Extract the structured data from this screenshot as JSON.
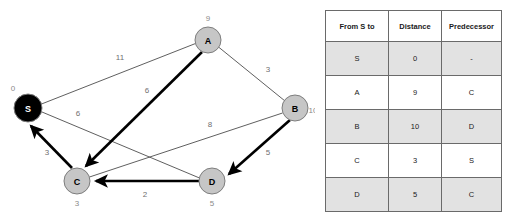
{
  "graph": {
    "nodes": [
      {
        "id": "S",
        "label": "S",
        "distance": "0",
        "cx": 28,
        "cy": 108,
        "r": 14,
        "style": "black",
        "dist_x": 13,
        "dist_y": 88
      },
      {
        "id": "A",
        "label": "A",
        "distance": "9",
        "cx": 208,
        "cy": 40,
        "r": 13,
        "style": "gray",
        "dist_x": 208,
        "dist_y": 18
      },
      {
        "id": "B",
        "label": "B",
        "distance": "10",
        "cx": 295,
        "cy": 108,
        "r": 13,
        "style": "gray",
        "dist_x": 317,
        "dist_y": 110
      },
      {
        "id": "C",
        "label": "C",
        "distance": "3",
        "cx": 77,
        "cy": 181,
        "r": 13,
        "style": "gray",
        "dist_x": 77,
        "dist_y": 203
      },
      {
        "id": "D",
        "label": "D",
        "distance": "5",
        "cx": 212,
        "cy": 181,
        "r": 13,
        "style": "gray",
        "dist_x": 212,
        "dist_y": 203
      }
    ],
    "edges": [
      {
        "id": "S-A",
        "from": "S",
        "to": "A",
        "weight": "11",
        "kind": "thin",
        "directed": false,
        "label_x": 120,
        "label_y": 57
      },
      {
        "id": "A-B",
        "from": "A",
        "to": "B",
        "weight": "3",
        "kind": "thin",
        "directed": false,
        "label_x": 268,
        "label_y": 69
      },
      {
        "id": "S-D",
        "from": "S",
        "to": "D",
        "weight": "6",
        "kind": "thin",
        "directed": false,
        "label_x": 78,
        "label_y": 113
      },
      {
        "id": "B-C",
        "from": "B",
        "to": "C",
        "weight": "8",
        "kind": "thin",
        "directed": false,
        "label_x": 210,
        "label_y": 124
      },
      {
        "id": "A-C",
        "from": "A",
        "to": "C",
        "weight": "6",
        "kind": "thick",
        "directed": true,
        "label_x": 147,
        "label_y": 90
      },
      {
        "id": "C-S",
        "from": "C",
        "to": "S",
        "weight": "3",
        "kind": "thick",
        "directed": true,
        "label_x": 47,
        "label_y": 152
      },
      {
        "id": "B-D",
        "from": "B",
        "to": "D",
        "weight": "5",
        "kind": "thick",
        "directed": true,
        "label_x": 268,
        "label_y": 152
      },
      {
        "id": "D-C",
        "from": "D",
        "to": "C",
        "weight": "2",
        "kind": "thick",
        "directed": true,
        "label_x": 145,
        "label_y": 194
      }
    ]
  },
  "table": {
    "headers": [
      "From S to",
      "Distance",
      "Predecessor"
    ],
    "rows": [
      {
        "from": "S",
        "distance": "0",
        "predecessor": "-"
      },
      {
        "from": "A",
        "distance": "9",
        "predecessor": "C"
      },
      {
        "from": "B",
        "distance": "10",
        "predecessor": "D"
      },
      {
        "from": "C",
        "distance": "3",
        "predecessor": "S"
      },
      {
        "from": "D",
        "distance": "5",
        "predecessor": "C"
      }
    ]
  },
  "colors": {
    "node_gray": "#c6c6c6",
    "node_black": "#000000",
    "edge_thin": "#4d4d4d",
    "edge_thick": "#000000",
    "row_shaded": "#e2e2e2",
    "table_border": "#6a6a6a"
  }
}
